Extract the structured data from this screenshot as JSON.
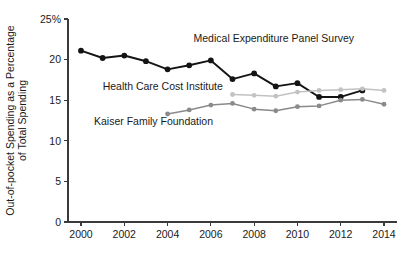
{
  "chart_data": {
    "type": "line",
    "title": "",
    "xlabel": "",
    "ylabel": "Out-of-pocket Spending as a Percentage of Total Spending",
    "ylabel_line1": "Out-of-pocket Spending as a Percentage",
    "ylabel_line2": "of Total Spending",
    "x": [
      2000,
      2001,
      2002,
      2003,
      2004,
      2005,
      2006,
      2007,
      2008,
      2009,
      2010,
      2011,
      2012,
      2013,
      2014
    ],
    "xlim": [
      1999.4,
      2014.6
    ],
    "ylim": [
      0,
      25
    ],
    "xticks": [
      2000,
      2002,
      2004,
      2006,
      2008,
      2010,
      2012,
      2014
    ],
    "xtick_labels": [
      "2000",
      "2002",
      "2004",
      "2006",
      "2008",
      "2010",
      "2012",
      "2014"
    ],
    "yticks": [
      0,
      5,
      10,
      15,
      20,
      25
    ],
    "ytick_labels": [
      "0",
      "5",
      "10",
      "15",
      "20",
      "25%"
    ],
    "grid": false,
    "legend_position": "inline-annotations",
    "series": [
      {
        "name": "Medical Expenditure Panel Survey",
        "color": "#141414",
        "x": [
          2000,
          2001,
          2002,
          2003,
          2004,
          2005,
          2006,
          2007,
          2008,
          2009,
          2010,
          2011,
          2012,
          2013
        ],
        "values": [
          21.1,
          20.2,
          20.5,
          19.8,
          18.8,
          19.3,
          19.9,
          17.6,
          18.3,
          16.7,
          17.1,
          15.4,
          15.4,
          16.2
        ],
        "label_x": 2005.2,
        "label_y": 22.2,
        "label_anchor": "start"
      },
      {
        "name": "Health Care Cost Institute",
        "color": "#c2c2c2",
        "x": [
          2007,
          2008,
          2009,
          2010,
          2011,
          2012,
          2013,
          2014
        ],
        "values": [
          15.7,
          15.6,
          15.5,
          16.0,
          16.2,
          16.3,
          16.4,
          16.2
        ],
        "label_x": 2001.0,
        "label_y": 16.3,
        "label_anchor": "start"
      },
      {
        "name": "Kaiser Family Foundation",
        "color": "#8a8a8a",
        "x": [
          2004,
          2005,
          2006,
          2007,
          2008,
          2009,
          2010,
          2011,
          2012,
          2013,
          2014
        ],
        "values": [
          13.3,
          13.8,
          14.4,
          14.6,
          13.9,
          13.7,
          14.2,
          14.3,
          15.0,
          15.1,
          14.5
        ],
        "label_x": 2000.6,
        "label_y": 11.9,
        "label_anchor": "start"
      }
    ]
  }
}
